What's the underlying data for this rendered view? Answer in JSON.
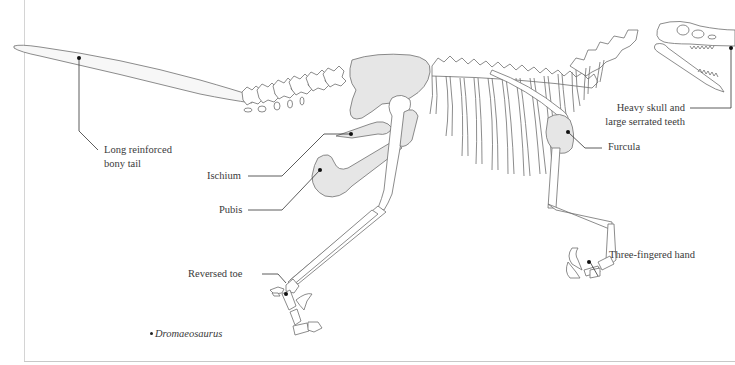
{
  "diagram": {
    "subject": "Dromaeosaurus",
    "species_label": "Dromaeosaurus",
    "colors": {
      "bone_outline": "#6e6e6e",
      "bone_fill": "#ffffff",
      "highlight_fill": "#e6e6e6",
      "leader_line": "#333333",
      "label_text": "#3a3a3a",
      "frame_rule": "#d0d0d0"
    },
    "labels": [
      {
        "id": "tail",
        "line1": "Long reinforced",
        "line2": "bony tail"
      },
      {
        "id": "ischium",
        "line1": "Ischium"
      },
      {
        "id": "pubis",
        "line1": "Pubis"
      },
      {
        "id": "reversed-toe",
        "line1": "Reversed toe"
      },
      {
        "id": "skull",
        "line1": "Heavy skull and",
        "line2": "large serrated teeth"
      },
      {
        "id": "furcula",
        "line1": "Furcula"
      },
      {
        "id": "hand",
        "line1": "Three-fingered hand"
      }
    ]
  }
}
